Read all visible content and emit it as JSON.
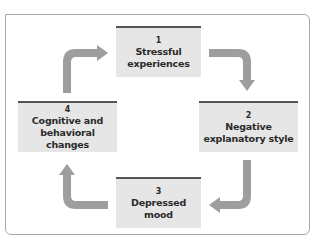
{
  "diagram": {
    "type": "cycle",
    "colors": {
      "box_fill": "#e6e6e6",
      "box_bar": "#555555",
      "arrow": "#9e9e9e",
      "frame": "#a8a8a8",
      "text": "#2a2a2a"
    },
    "nodes": [
      {
        "num": "1",
        "label": "Stressful\nexperiences"
      },
      {
        "num": "2",
        "label": "Negative\nexplanatory style"
      },
      {
        "num": "3",
        "label": "Depressed\nmood"
      },
      {
        "num": "4",
        "label": "Cognitive and\nbehavioral changes"
      }
    ],
    "edges": [
      {
        "from": "1",
        "to": "2"
      },
      {
        "from": "2",
        "to": "3"
      },
      {
        "from": "3",
        "to": "4"
      },
      {
        "from": "4",
        "to": "1"
      }
    ]
  }
}
